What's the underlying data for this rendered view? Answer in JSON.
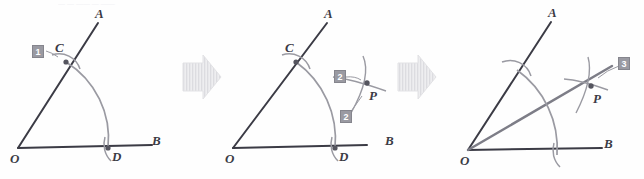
{
  "figure": {
    "title_fragment": "— — —— — ——",
    "panels": [
      {
        "id": "panel-1",
        "step": "1",
        "labels": {
          "vertex_o": "O",
          "ray_a": "A",
          "ray_b": "B",
          "point_c": "C",
          "point_d": "D"
        }
      },
      {
        "id": "panel-2",
        "step_upper": "2",
        "step_lower": "2",
        "labels": {
          "vertex_o": "O",
          "ray_a": "A",
          "ray_b": "B",
          "point_c": "C",
          "point_d": "D",
          "point_p": "P"
        }
      },
      {
        "id": "panel-3",
        "step": "3",
        "labels": {
          "vertex_o": "O",
          "ray_a": "A",
          "ray_b": "B",
          "point_p": "P"
        }
      }
    ],
    "arrows": [
      {
        "id": "arrow-1-2",
        "glyph": "right-arrow"
      },
      {
        "id": "arrow-2-3",
        "glyph": "right-arrow"
      }
    ],
    "colors": {
      "ray_dark": "#3b3b45",
      "arc_gray": "#8d8d95",
      "bisector_gray": "#7d7d87",
      "badge_fill": "#9a9aa2",
      "badge_text": "#ffffff",
      "label_text": "#3b3b45",
      "arrow_fill": "#e6e6e8",
      "background": "#fefefe"
    }
  }
}
